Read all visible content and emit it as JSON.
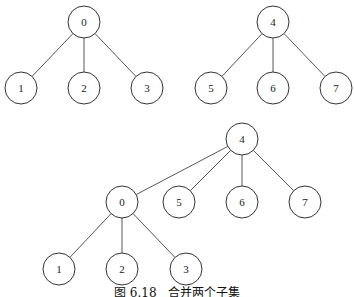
{
  "caption": "图 6.18   合并两个子集",
  "node_radius": 16,
  "trees": [
    {
      "name": "subset-0",
      "nodes": [
        {
          "label": "0",
          "x": 84,
          "y": 22
        },
        {
          "label": "1",
          "x": 21,
          "y": 88
        },
        {
          "label": "2",
          "x": 84,
          "y": 88
        },
        {
          "label": "3",
          "x": 147,
          "y": 88
        }
      ],
      "edges": [
        [
          0,
          1
        ],
        [
          0,
          2
        ],
        [
          0,
          3
        ]
      ]
    },
    {
      "name": "subset-4",
      "nodes": [
        {
          "label": "4",
          "x": 273,
          "y": 22
        },
        {
          "label": "5",
          "x": 211,
          "y": 88
        },
        {
          "label": "6",
          "x": 273,
          "y": 88
        },
        {
          "label": "7",
          "x": 336,
          "y": 88
        }
      ],
      "edges": [
        [
          0,
          1
        ],
        [
          0,
          2
        ],
        [
          0,
          3
        ]
      ]
    },
    {
      "name": "merged",
      "nodes": [
        {
          "label": "4",
          "x": 242,
          "y": 139
        },
        {
          "label": "0",
          "x": 122,
          "y": 202
        },
        {
          "label": "5",
          "x": 179,
          "y": 202
        },
        {
          "label": "6",
          "x": 242,
          "y": 202
        },
        {
          "label": "7",
          "x": 305,
          "y": 202
        },
        {
          "label": "1",
          "x": 59,
          "y": 269
        },
        {
          "label": "2",
          "x": 122,
          "y": 269
        },
        {
          "label": "3",
          "x": 186,
          "y": 269
        }
      ],
      "edges": [
        [
          0,
          1
        ],
        [
          0,
          2
        ],
        [
          0,
          3
        ],
        [
          0,
          4
        ],
        [
          1,
          5
        ],
        [
          1,
          6
        ],
        [
          1,
          7
        ]
      ]
    }
  ]
}
